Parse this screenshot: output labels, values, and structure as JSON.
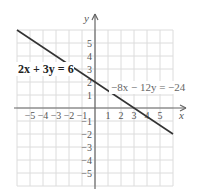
{
  "chart_data": {
    "type": "line",
    "title": "",
    "xlabel": "x",
    "ylabel": "y",
    "xlim": [
      -6,
      6
    ],
    "ylim": [
      -6,
      6
    ],
    "grid": true,
    "x_ticks": [
      "-5",
      "-4",
      "-3",
      "-2",
      "-1",
      "1",
      "2",
      "3",
      "4",
      "5"
    ],
    "y_ticks": [
      "5",
      "4",
      "3",
      "2",
      "1",
      "-1",
      "-2",
      "-3",
      "-4",
      "-5"
    ],
    "series": [
      {
        "name": "2x + 3y = 6",
        "equivalent": "-8x - 12y = -24",
        "points": [
          [
            -6,
            6
          ],
          [
            0,
            2
          ],
          [
            3,
            0
          ],
          [
            6,
            -2
          ]
        ]
      }
    ],
    "annotations": [
      {
        "text": "2x + 3y = 6",
        "x": -5.7,
        "y": 2.5,
        "style": "bold"
      },
      {
        "text": "−8x − 12y = −24",
        "x": 1.1,
        "y": 1.3,
        "style": "regular"
      }
    ]
  },
  "labels": {
    "x_axis": "x",
    "y_axis": "y",
    "eq1": "2x + 3y = 6",
    "eq2": "−8x − 12y = −24"
  },
  "ticks": {
    "x": [
      {
        "v": -5,
        "t": "−5"
      },
      {
        "v": -4,
        "t": "−4"
      },
      {
        "v": -3,
        "t": "−3"
      },
      {
        "v": -2,
        "t": "−2"
      },
      {
        "v": -1,
        "t": "−1"
      },
      {
        "v": 1,
        "t": "1"
      },
      {
        "v": 2,
        "t": "2"
      },
      {
        "v": 3,
        "t": "3"
      },
      {
        "v": 4,
        "t": "4"
      },
      {
        "v": 5,
        "t": "5"
      }
    ],
    "y": [
      {
        "v": 5,
        "t": "5"
      },
      {
        "v": 4,
        "t": "4"
      },
      {
        "v": 3,
        "t": "3"
      },
      {
        "v": 2,
        "t": "2"
      },
      {
        "v": 1,
        "t": "1"
      },
      {
        "v": -1,
        "t": "−1"
      },
      {
        "v": -2,
        "t": "−2"
      },
      {
        "v": -3,
        "t": "−3"
      },
      {
        "v": -4,
        "t": "−4"
      },
      {
        "v": -5,
        "t": "−5"
      }
    ]
  }
}
